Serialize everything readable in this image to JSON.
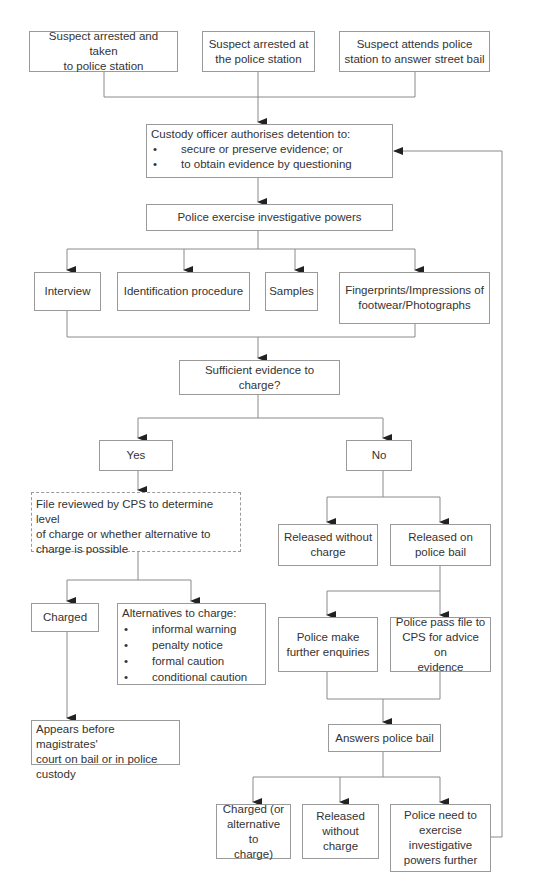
{
  "diagram": {
    "type": "flowchart",
    "colors": {
      "line": "#8a8a8a",
      "arrow": "#222222",
      "border": "#9a9a9a",
      "text": "#333333"
    },
    "nodes": {
      "start_1": "Suspect arrested and taken\nto police station",
      "start_2": "Suspect arrested at\nthe  police station",
      "start_3": "Suspect attends police\nstation to answer street bail",
      "custody": {
        "title": "Custody officer authorises detention to:",
        "bullets": [
          "secure or preserve evidence; or",
          "to obtain evidence by questioning"
        ]
      },
      "powers": "Police exercise investigative powers",
      "interview": "Interview",
      "identification": "Identification procedure",
      "samples": "Samples",
      "fingerprints": "Fingerprints/Impressions of\nfootwear/Photographs",
      "sufficient": "Sufficient evidence to charge?",
      "yes": "Yes",
      "no": "No",
      "file_reviewed": "File reviewed by CPS to determine level\nof charge or whether alternative to\ncharge is possible",
      "released_without": "Released without\ncharge",
      "released_bail": "Released on\npolice bail",
      "charged": "Charged",
      "alternatives": {
        "title": "Alternatives to charge:",
        "bullets": [
          "informal warning",
          "penalty notice",
          "formal caution",
          "conditional caution"
        ]
      },
      "further_enquiries": "Police make\nfurther enquiries",
      "pass_file": "Police pass file to\nCPS for advice on\nevidence",
      "appears": "Appears before magistrates'\ncourt on bail or in police\ncustody",
      "answers_bail": "Answers police bail",
      "charged_alt": "Charged (or\nalternative to\ncharge)",
      "released_without_2": "Released\nwithout\ncharge",
      "police_need": "Police need to\nexercise\ninvestigative\npowers further"
    }
  }
}
